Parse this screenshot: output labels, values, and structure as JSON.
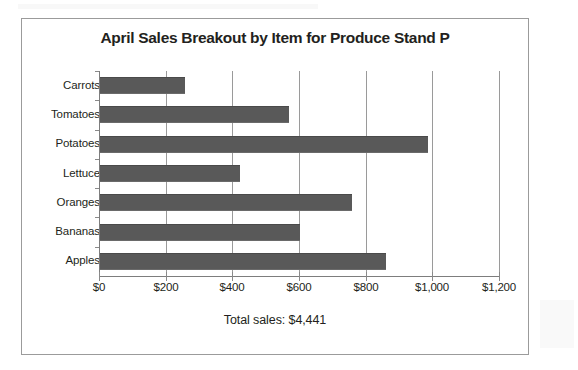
{
  "chart_data": {
    "type": "bar",
    "orientation": "horizontal",
    "title": "April Sales Breakout by Item for Produce Stand P",
    "categories": [
      "Carrots",
      "Tomatoes",
      "Potatoes",
      "Lettuce",
      "Oranges",
      "Bananas",
      "Apples"
    ],
    "values": [
      255,
      566,
      983,
      421,
      757,
      601,
      858
    ],
    "xlabel": "",
    "ylabel": "",
    "xlim": [
      0,
      1200
    ],
    "xticks": [
      0,
      200,
      400,
      600,
      800,
      1000,
      1200
    ],
    "xtick_labels": [
      "$0",
      "$200",
      "$400",
      "$600",
      "$800",
      "$1,000",
      "$1,200"
    ],
    "grid": "vertical",
    "legend": "none",
    "annotation": "Total sales: $4,441",
    "bar_color": "#595959",
    "gridline_color": "#9a9a9a",
    "axis_color": "#7d7d7d",
    "text_color": "#231f20",
    "frame_color": "#9b9b9b"
  },
  "footer": {
    "total_label": "Total sales: $4,441"
  }
}
